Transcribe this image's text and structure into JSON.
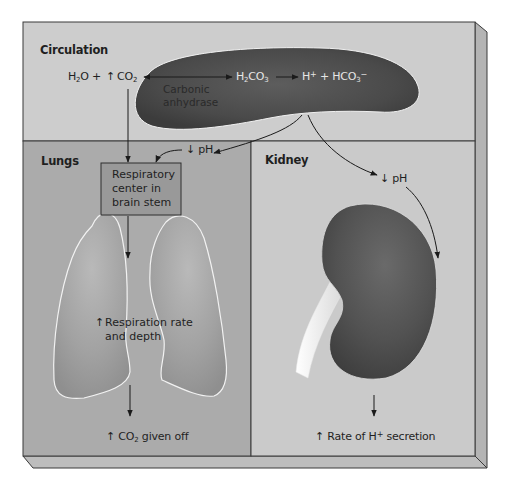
{
  "diagram": {
    "panels": {
      "circulation": {
        "title": "Circulation"
      },
      "lungs": {
        "title": "Lungs"
      },
      "kidney": {
        "title": "Kidney"
      }
    },
    "reaction": {
      "reactant_h2o": "H",
      "reactant_h2o_sub": "2",
      "reactant_h2o_tail": "O +",
      "increase_arrow": "↑",
      "reactant_co2": "CO",
      "reactant_co2_sub": "2",
      "intermediate": "H",
      "intermediate_sub": "2",
      "intermediate_tail": "CO",
      "intermediate_sub2": "3",
      "product_h": "H",
      "product_h_sup": "+",
      "product_plus": "+ HCO",
      "product_hco3_sub": "3",
      "product_hco3_sup": "−",
      "enzyme_line1": "Carbonic",
      "enzyme_line2": "anhydrase"
    },
    "lungs_flow": {
      "ph_arrow": "↓",
      "ph_label": "pH",
      "center_line1": "Respiratory",
      "center_line2": "center in",
      "center_line3": "brain stem",
      "resp_arrow": "↑",
      "resp_line1": "Respiration rate",
      "resp_line2": "and depth",
      "out_arrow": "↑",
      "out_co": "CO",
      "out_sub": "2",
      "out_tail": " given off"
    },
    "kidney_flow": {
      "ph_arrow": "↓",
      "ph_label": "pH",
      "out_arrow": "↑",
      "out_text": "Rate of H",
      "out_sup": "+",
      "out_tail": " secretion"
    },
    "colors": {
      "circulation_bg": "#cdcdcd",
      "lungs_bg": "#ababab",
      "kidney_bg": "#cacaca",
      "blood_cell": "#4e4e4e",
      "kidney_organ": "#555555",
      "lung_fill": "#a3a3a3",
      "center_box": "#999999"
    }
  }
}
